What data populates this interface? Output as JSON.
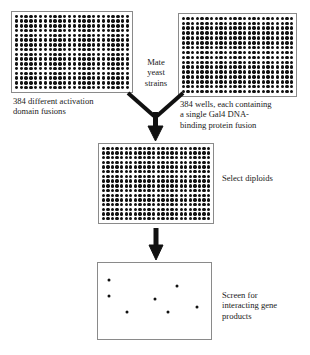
{
  "diagram": {
    "colors": {
      "well": "#111111",
      "plate_border": "#8a8a8a",
      "arrow": "#111111",
      "text": "#1a1a1a",
      "background": "#ffffff"
    }
  },
  "plates": {
    "activation_domain": {
      "name": "384 activation domain plate",
      "rows": 16,
      "cols": 24,
      "wells": 384
    },
    "dna_binding": {
      "name": "384 DNA-binding domain plate",
      "rows": 16,
      "cols": 24,
      "wells": 384
    },
    "diploid": {
      "name": "384 diploid selection plate",
      "rows": 16,
      "cols": 24,
      "wells": 384
    },
    "screen": {
      "name": "interaction screen plate",
      "colonies": [
        {
          "x": 10,
          "y": 22
        },
        {
          "x": 10,
          "y": 44
        },
        {
          "x": 26,
          "y": 65
        },
        {
          "x": 50,
          "y": 48
        },
        {
          "x": 62,
          "y": 65
        },
        {
          "x": 70,
          "y": 30
        },
        {
          "x": 88,
          "y": 58
        }
      ],
      "colony_count": 7
    }
  },
  "labels": {
    "activation_domain": "384 different activation\ndomain fusions",
    "dna_binding": "384 wells, each containing\na single Gal4 DNA-\nbinding protein fusion",
    "mate": "Mate\nyeast\nstrains",
    "select_diploids": "Select diploids",
    "screen": "Screen for\ninteracting gene\nproducts"
  },
  "arrows": {
    "mate_merge": "merge-arrow-down",
    "select_diploids": "arrow-down"
  }
}
